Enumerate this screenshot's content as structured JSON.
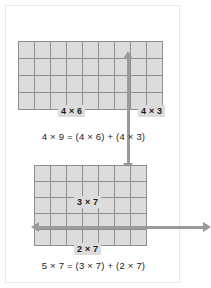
{
  "figures": [
    {
      "id": "array-model-4x9",
      "grid": {
        "columns": 9,
        "rows": 4,
        "split_after_column": 6
      },
      "divider": {
        "orientation": "vertical",
        "icon": "double-arrow-vertical-icon"
      },
      "labels": {
        "part_a": "4 × 6",
        "part_b": "4 × 3"
      },
      "caption": "4 × 9 = (4 × 6) + (4 × 3)"
    },
    {
      "id": "array-model-5x7",
      "grid": {
        "columns": 7,
        "rows": 5,
        "split_after_row": 3
      },
      "divider": {
        "orientation": "horizontal",
        "icon": "double-arrow-horizontal-icon"
      },
      "labels": {
        "part_a": "3 × 7",
        "part_b": "2 × 7"
      },
      "caption": "5 × 7 = (3 × 7) + (2 × 7)"
    }
  ],
  "colors": {
    "page_background": "#fdfdfd",
    "card_background": "#ffffff",
    "card_border": "#e8e8e8",
    "cell_fill": "#dcdcdc",
    "grid_line": "#8f8f8f",
    "arrow": "#9a9a9a",
    "text": "#1b1b1b"
  }
}
